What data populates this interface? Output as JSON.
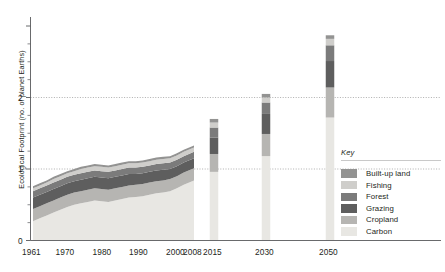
{
  "chart_data": {
    "type": "area",
    "title": "",
    "subtitle": "",
    "xlabel": "",
    "ylabel": "Ecological Footprint (no. of planet Earths)",
    "xlim": [
      1961,
      2050
    ],
    "ylim": [
      0,
      3.05
    ],
    "yticks": [
      0,
      1,
      2
    ],
    "ytick_labels": [
      "0",
      "1",
      "2"
    ],
    "grid": false,
    "reference_lines": [
      1,
      2
    ],
    "legend_position": "right",
    "legend_title": "Key",
    "stack_order_top_to_bottom": [
      "Built-up land",
      "Fishing",
      "Forest",
      "Grazing",
      "Cropland",
      "Carbon"
    ],
    "x": [
      1961,
      1963,
      1965,
      1967,
      1969,
      1971,
      1973,
      1975,
      1977,
      1979,
      1981,
      1983,
      1985,
      1987,
      1989,
      1991,
      1993,
      1995,
      1997,
      1999,
      2001,
      2003,
      2005,
      2008
    ],
    "xtick_labels": [
      "1961",
      "1970",
      "1980",
      "1990",
      "2000",
      "2008",
      "2015",
      "2030",
      "2050"
    ],
    "xticks": [
      1961,
      1970,
      1980,
      1990,
      2000,
      2008,
      2015,
      2030,
      2050
    ],
    "series": [
      {
        "name": "Carbon",
        "color": "#e8e7e3",
        "values": [
          0.27,
          0.31,
          0.35,
          0.39,
          0.43,
          0.47,
          0.5,
          0.52,
          0.54,
          0.56,
          0.55,
          0.54,
          0.56,
          0.58,
          0.6,
          0.61,
          0.62,
          0.64,
          0.66,
          0.67,
          0.69,
          0.73,
          0.78,
          0.84
        ]
      },
      {
        "name": "Cropland",
        "color": "#b6b5b2",
        "values": [
          0.17,
          0.17,
          0.17,
          0.17,
          0.17,
          0.17,
          0.17,
          0.17,
          0.17,
          0.17,
          0.17,
          0.17,
          0.17,
          0.17,
          0.17,
          0.17,
          0.17,
          0.17,
          0.17,
          0.17,
          0.17,
          0.17,
          0.17,
          0.17
        ]
      },
      {
        "name": "Grazing",
        "color": "#5e5e5e",
        "values": [
          0.16,
          0.16,
          0.16,
          0.16,
          0.16,
          0.16,
          0.16,
          0.16,
          0.16,
          0.16,
          0.16,
          0.16,
          0.16,
          0.16,
          0.16,
          0.15,
          0.15,
          0.15,
          0.15,
          0.15,
          0.14,
          0.14,
          0.14,
          0.14
        ]
      },
      {
        "name": "Forest",
        "color": "#7b7b7b",
        "values": [
          0.09,
          0.09,
          0.09,
          0.09,
          0.09,
          0.09,
          0.09,
          0.09,
          0.09,
          0.09,
          0.09,
          0.09,
          0.09,
          0.09,
          0.09,
          0.09,
          0.09,
          0.09,
          0.09,
          0.09,
          0.09,
          0.09,
          0.09,
          0.09
        ]
      },
      {
        "name": "Fishing",
        "color": "#cfcecb",
        "values": [
          0.04,
          0.04,
          0.04,
          0.05,
          0.05,
          0.05,
          0.05,
          0.06,
          0.06,
          0.06,
          0.06,
          0.06,
          0.06,
          0.06,
          0.06,
          0.06,
          0.06,
          0.06,
          0.06,
          0.06,
          0.06,
          0.06,
          0.06,
          0.06
        ]
      },
      {
        "name": "Built-up land",
        "color": "#939392",
        "values": [
          0.03,
          0.03,
          0.03,
          0.03,
          0.03,
          0.03,
          0.03,
          0.03,
          0.03,
          0.03,
          0.03,
          0.03,
          0.03,
          0.03,
          0.03,
          0.03,
          0.03,
          0.03,
          0.03,
          0.03,
          0.03,
          0.03,
          0.03,
          0.03
        ]
      }
    ],
    "totals": [
      0.76,
      0.8,
      0.84,
      0.89,
      0.93,
      0.97,
      1.0,
      1.03,
      1.05,
      1.07,
      1.06,
      1.05,
      1.07,
      1.09,
      1.11,
      1.11,
      1.12,
      1.14,
      1.16,
      1.17,
      1.18,
      1.22,
      1.27,
      1.33
    ],
    "projection_bars": [
      {
        "year": 2015,
        "label": "2015",
        "total": 1.7,
        "segments": [
          {
            "name": "Carbon",
            "value": 0.96,
            "color": "#e8e7e3"
          },
          {
            "name": "Cropland",
            "value": 0.25,
            "color": "#b6b5b2"
          },
          {
            "name": "Grazing",
            "value": 0.23,
            "color": "#5e5e5e"
          },
          {
            "name": "Forest",
            "value": 0.14,
            "color": "#7b7b7b"
          },
          {
            "name": "Fishing",
            "value": 0.07,
            "color": "#cfcecb"
          },
          {
            "name": "Built-up land",
            "value": 0.05,
            "color": "#939392"
          }
        ]
      },
      {
        "year": 2030,
        "label": "2030",
        "total": 2.05,
        "segments": [
          {
            "name": "Carbon",
            "value": 1.18,
            "color": "#e8e7e3"
          },
          {
            "name": "Cropland",
            "value": 0.31,
            "color": "#b6b5b2"
          },
          {
            "name": "Grazing",
            "value": 0.28,
            "color": "#5e5e5e"
          },
          {
            "name": "Forest",
            "value": 0.16,
            "color": "#7b7b7b"
          },
          {
            "name": "Fishing",
            "value": 0.07,
            "color": "#cfcecb"
          },
          {
            "name": "Built-up land",
            "value": 0.05,
            "color": "#939392"
          }
        ]
      },
      {
        "year": 2050,
        "label": "2050",
        "total": 2.87,
        "segments": [
          {
            "name": "Carbon",
            "value": 1.72,
            "color": "#e8e7e3"
          },
          {
            "name": "Cropland",
            "value": 0.42,
            "color": "#b6b5b2"
          },
          {
            "name": "Grazing",
            "value": 0.37,
            "color": "#5e5e5e"
          },
          {
            "name": "Forest",
            "value": 0.22,
            "color": "#7b7b7b"
          },
          {
            "name": "Fishing",
            "value": 0.09,
            "color": "#cfcecb"
          },
          {
            "name": "Built-up land",
            "value": 0.05,
            "color": "#939392"
          }
        ]
      }
    ]
  },
  "legend": {
    "title": "Key",
    "items": [
      {
        "label": "Built-up land",
        "color": "#939392"
      },
      {
        "label": "Fishing",
        "color": "#cfcecb"
      },
      {
        "label": "Forest",
        "color": "#7b7b7b"
      },
      {
        "label": "Grazing",
        "color": "#5e5e5e"
      },
      {
        "label": "Cropland",
        "color": "#b6b5b2"
      },
      {
        "label": "Carbon",
        "color": "#e8e7e3"
      }
    ]
  },
  "axis": {
    "y_title": "Ecological Footprint (no. of planet Earths)",
    "y_tick_0": "0",
    "y_tick_1": "1",
    "y_tick_2": "2",
    "x_tick_1961": "1961",
    "x_tick_1970": "1970",
    "x_tick_1980": "1980",
    "x_tick_1990": "1990",
    "x_tick_2000": "2000",
    "x_tick_2008": "2008",
    "x_tick_2015": "2015",
    "x_tick_2030": "2030",
    "x_tick_2050": "2050"
  },
  "colors": {
    "axis": "#58595b",
    "reference_line": "#9a9a9a",
    "text": "#231f20"
  }
}
